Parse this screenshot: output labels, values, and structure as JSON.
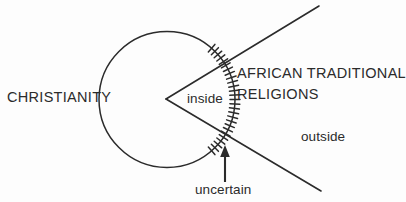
{
  "diagram": {
    "type": "overlapping-sets-venn",
    "background_color": "#fdfdfd",
    "stroke_color": "#2b2b2b",
    "labels": {
      "christianity": "CHRISTIANITY",
      "african_traditional_line1": "AFRICAN TRADITIONAL",
      "african_traditional_line2": "RELIGIONS",
      "inside": "inside",
      "outside": "outside",
      "uncertain": "uncertain"
    },
    "shapes": {
      "circle": {
        "name": "christianity-circle",
        "cx": 167,
        "cy": 99.5,
        "r": 68
      },
      "wedge": {
        "name": "african-traditional-religions-wedge",
        "vertex_x": 166,
        "vertex_y": 99,
        "upper_end_x": 319,
        "upper_end_y": 6,
        "lower_end_x": 321,
        "lower_end_y": 191
      },
      "hatch_band": {
        "name": "uncertain-boundary-hatching",
        "start_angle_deg": -49,
        "end_angle_deg": 49,
        "tick_count": 27,
        "tick_length": 10
      },
      "arrow": {
        "name": "uncertain-pointer-arrow",
        "shaft_x": 225,
        "tail_y": 182,
        "tip_y": 146
      }
    }
  }
}
